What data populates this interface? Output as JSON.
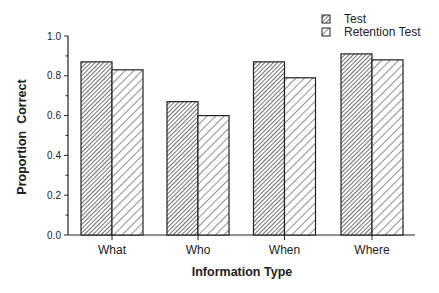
{
  "chart_data": {
    "type": "bar",
    "title": "",
    "xlabel": "Information Type",
    "ylabel": "Proportion  Correct",
    "categories": [
      "What",
      "Who",
      "When",
      "Where"
    ],
    "series": [
      {
        "name": "Test",
        "pattern": "dense-hatch",
        "values": [
          0.87,
          0.67,
          0.87,
          0.91
        ]
      },
      {
        "name": "Retention Test",
        "pattern": "sparse-hatch",
        "values": [
          0.83,
          0.6,
          0.79,
          0.88
        ]
      }
    ],
    "ylim": [
      0.0,
      1.0
    ],
    "yticks": [
      "0.0",
      "0.2",
      "0.4",
      "0.6",
      "0.8",
      "1.0"
    ],
    "grid": false,
    "legend_position": "top-right"
  },
  "colors": {
    "stroke": "#222222",
    "background": "#ffffff"
  }
}
